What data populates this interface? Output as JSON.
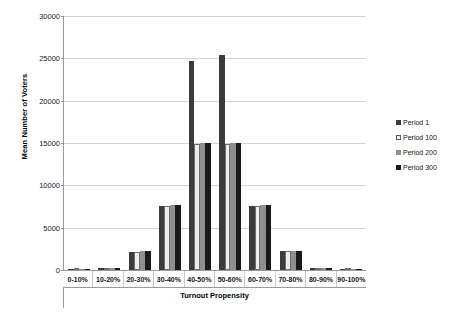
{
  "chart_data": {
    "type": "bar",
    "title": "",
    "xlabel": "Turnout Propensity",
    "ylabel": "Mean Number of Voters",
    "ylim": [
      0,
      30000
    ],
    "yticks": [
      0,
      5000,
      10000,
      15000,
      20000,
      25000,
      30000
    ],
    "ytick_labels": [
      "0",
      "5000",
      "10000",
      "15000",
      "20000",
      "25000",
      "30000"
    ],
    "grid": true,
    "legend_position": "right",
    "categories": [
      "0-10%",
      "10-20%",
      "20-30%",
      "30-40%",
      "40-50%",
      "50-60%",
      "60-70%",
      "70-80%",
      "80-90%",
      "90-100%"
    ],
    "series": [
      {
        "name": "Period 1",
        "color": "#3b3b3b",
        "values": [
          60,
          230,
          2150,
          7600,
          24700,
          25400,
          7600,
          2200,
          250,
          60
        ]
      },
      {
        "name": "Period 100",
        "color": "#ededed",
        "values": [
          50,
          210,
          2150,
          7600,
          14900,
          14900,
          7600,
          2200,
          230,
          50
        ]
      },
      {
        "name": "Period 200",
        "color": "#8f8f8f",
        "values": [
          50,
          220,
          2200,
          7650,
          14950,
          14950,
          7650,
          2250,
          240,
          50
        ]
      },
      {
        "name": "Period 300",
        "color": "#1a1a1a",
        "values": [
          50,
          240,
          2200,
          7650,
          14950,
          14950,
          7650,
          2250,
          250,
          50
        ]
      }
    ]
  },
  "legend": {
    "entries": [
      {
        "label": "Period 1"
      },
      {
        "label": "Period 100"
      },
      {
        "label": "Period 200"
      },
      {
        "label": "Period 300"
      }
    ]
  }
}
